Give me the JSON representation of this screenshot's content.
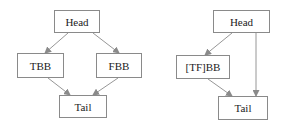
{
  "diagrams": [
    {
      "name": "left-cfg",
      "nodes": [
        {
          "id": "head",
          "label": "Head"
        },
        {
          "id": "tbb",
          "label": "TBB"
        },
        {
          "id": "fbb",
          "label": "FBB"
        },
        {
          "id": "tail",
          "label": "Tail"
        }
      ],
      "edges": [
        [
          "head",
          "tbb"
        ],
        [
          "head",
          "fbb"
        ],
        [
          "tbb",
          "tail"
        ],
        [
          "fbb",
          "tail"
        ]
      ]
    },
    {
      "name": "right-cfg",
      "nodes": [
        {
          "id": "head",
          "label": "Head"
        },
        {
          "id": "tfbb",
          "label": "[TF]BB"
        },
        {
          "id": "tail",
          "label": "Tail"
        }
      ],
      "edges": [
        [
          "head",
          "tfbb"
        ],
        [
          "head",
          "tail"
        ],
        [
          "tfbb",
          "tail"
        ]
      ]
    }
  ],
  "colors": {
    "border": "#8a8a8a",
    "edge": "#8a8a8a",
    "text": "#222222"
  }
}
